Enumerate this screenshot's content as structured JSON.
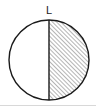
{
  "figure": {
    "type": "geometry-diagram",
    "canvas": {
      "width": 96,
      "height": 108,
      "background_color": "#ffffff"
    },
    "labels": [
      {
        "id": "label-L",
        "text": "L",
        "x": 49,
        "y": 14,
        "font_size": 11,
        "color": "#1a1a1a"
      }
    ],
    "shapes": {
      "circle": {
        "name": "outer-circle",
        "center_x": 49,
        "center_y": 60,
        "radius": 40,
        "stroke_color": "#1a1a1a",
        "stroke_width": 1.4,
        "fill": "none"
      },
      "diameter_line": {
        "name": "vertical-diameter",
        "x1": 49,
        "y1": 20,
        "x2": 49,
        "y2": 100,
        "stroke_color": "#1a1a1a",
        "stroke_width": 1.4
      },
      "hatched_region": {
        "name": "right-semicircle-hatch",
        "side": "right",
        "hatch_direction": "forward-slash",
        "hatch_angle_deg": 45,
        "hatch_spacing": 3,
        "hatch_stroke_color": "#3a3a3a",
        "hatch_stroke_width": 0.7,
        "fill": "#ffffff"
      },
      "baseline_artifact": {
        "name": "bottom-edge-line",
        "x1": 0,
        "y1": 105.5,
        "x2": 96,
        "y2": 105.5,
        "stroke_color": "#d8d8d8",
        "stroke_width": 1
      }
    }
  }
}
